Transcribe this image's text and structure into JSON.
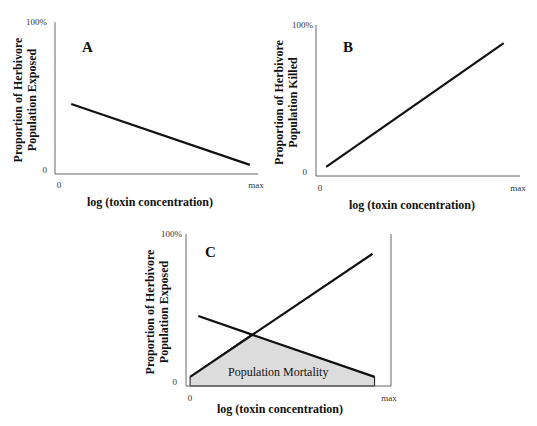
{
  "chart_data": [
    {
      "type": "line",
      "panel": "A",
      "xlabel": "log (toxin concentration)",
      "ylabel": [
        "Proportion of Herbivore",
        "Population Exposed"
      ],
      "x_ticks": [
        "0",
        "max"
      ],
      "y_ticks": [
        "0",
        "100%"
      ],
      "xlim": [
        0,
        1
      ],
      "ylim": [
        0,
        100
      ],
      "series": [
        {
          "name": "Proportion Exposed",
          "x": [
            0.08,
            0.96
          ],
          "y": [
            46,
            6
          ]
        }
      ]
    },
    {
      "type": "line",
      "panel": "B",
      "xlabel": "log (toxin concentration)",
      "ylabel": [
        "Proportion of Herbivore",
        "Population Killed"
      ],
      "x_ticks": [
        "0",
        "max"
      ],
      "y_ticks": [
        "0",
        "100%"
      ],
      "xlim": [
        0,
        1
      ],
      "ylim": [
        0,
        100
      ],
      "series": [
        {
          "name": "Proportion Killed",
          "x": [
            0.05,
            0.92
          ],
          "y": [
            6,
            88
          ]
        }
      ]
    },
    {
      "type": "area",
      "panel": "C",
      "xlabel": "log (toxin concentration)",
      "ylabel": [
        "Proportion of Herbivore",
        "Population Exposed"
      ],
      "x_ticks": [
        "0",
        "max"
      ],
      "y_ticks": [
        "0",
        "100%"
      ],
      "xlim": [
        0,
        1
      ],
      "ylim": [
        0,
        100
      ],
      "series": [
        {
          "name": "Proportion Killed",
          "x": [
            0.02,
            0.91
          ],
          "y": [
            6,
            87
          ]
        },
        {
          "name": "Proportion Exposed",
          "x": [
            0.06,
            0.92
          ],
          "y": [
            46,
            6
          ]
        }
      ],
      "area": {
        "label": "Population Mortality",
        "x": [
          0.02,
          0.02,
          0.32,
          0.92,
          0.92
        ],
        "y": [
          0,
          6,
          34,
          6,
          0
        ],
        "color": "#dcdcdc"
      }
    }
  ],
  "colors": {
    "line": "#111111",
    "axis": "#666666",
    "fill": "#dcdcdc"
  }
}
